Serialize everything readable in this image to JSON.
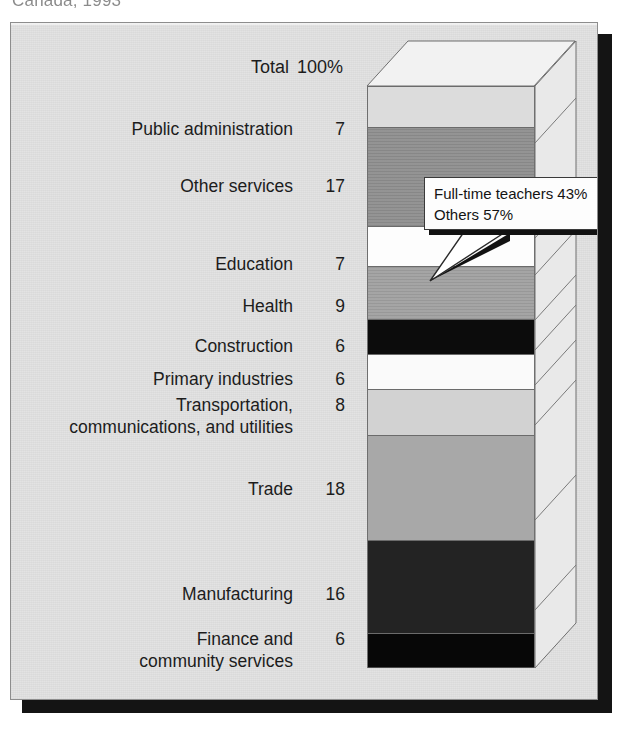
{
  "figure": {
    "clipped_title": "Canada, 1993",
    "total_label": "Total",
    "total_value": "100%"
  },
  "callout": {
    "line1": "Full-time teachers 43%",
    "line2": "Others 57%"
  },
  "chart_data": {
    "type": "bar",
    "orientation": "vertical-stacked-3d",
    "title": "Canada, 1993",
    "xlabel": "",
    "ylabel": "",
    "units": "percent",
    "total_label": "Total",
    "total_value": 100,
    "grid": false,
    "legend": "none",
    "annotations": [
      "Full-time teachers 43%",
      "Others 57%"
    ],
    "categories": [
      "Public administration",
      "Other services",
      "Education",
      "Health",
      "Construction",
      "Primary industries",
      "Transportation,\ncommunications, and utilities",
      "Trade",
      "Manufacturing",
      "Finance and\ncommunity services"
    ],
    "values": [
      7,
      17,
      7,
      9,
      6,
      6,
      8,
      18,
      16,
      6
    ],
    "value_labels": [
      "7",
      "17",
      "7",
      "9",
      "6",
      "6",
      "8",
      "18",
      "16",
      "6"
    ],
    "segment_fills": [
      "#dcdcdc",
      "#8e8e8e",
      "#fdfdfd",
      "#a0a0a0",
      "#0c0c0c",
      "#fafafa",
      "#d2d2d2",
      "#a8a8a8",
      "#232323",
      "#070707"
    ]
  },
  "rows": [
    {
      "name": "Public administration",
      "value": "7",
      "top": 95,
      "fill": "#dcdcdc",
      "h": 58,
      "texture": false
    },
    {
      "name": "Other services",
      "value": "17",
      "top": 152,
      "fill": "#8e8e8e",
      "h": 95,
      "texture": true
    },
    {
      "name": "Education",
      "value": "7",
      "top": 230,
      "fill": "#fdfdfd",
      "h": 37,
      "texture": false
    },
    {
      "name": "Health",
      "value": "9",
      "top": 272,
      "fill": "#a0a0a0",
      "h": 45,
      "texture": true
    },
    {
      "name": "Construction",
      "value": "6",
      "top": 312,
      "fill": "#0c0c0c",
      "h": 30,
      "texture": false
    },
    {
      "name": "Primary industries",
      "value": "6",
      "top": 345,
      "fill": "#fafafa",
      "h": 35,
      "texture": false
    },
    {
      "name": "Transportation,\ncommunications, and utilities",
      "value": "8",
      "top": 371,
      "fill": "#d2d2d2",
      "h": 40,
      "texture": false
    },
    {
      "name": "Trade",
      "value": "18",
      "top": 455,
      "fill": "#a8a8a8",
      "h": 95,
      "texture": false
    },
    {
      "name": "Manufacturing",
      "value": "16",
      "top": 560,
      "fill": "#232323",
      "h": 90,
      "texture": false
    },
    {
      "name": "Finance and\ncommunity services",
      "value": "6",
      "top": 605,
      "fill": "#070707",
      "h": 35,
      "texture": false
    }
  ],
  "colors": {
    "panel_background": "#e2e2e2",
    "frame_border": "#8d8d8d",
    "drop_shadow": "#141414",
    "text": "#1c1c1c",
    "top_face": "#f2f2f2",
    "side_face": "#e8e8e8",
    "edge": "#6f6f6f"
  }
}
